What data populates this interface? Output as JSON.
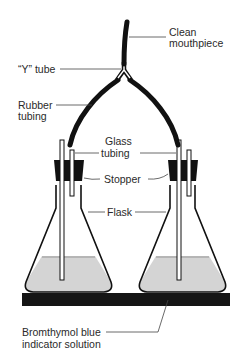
{
  "diagram": {
    "labels": {
      "mouthpiece_line1": "Clean",
      "mouthpiece_line2": "mouthpiece",
      "y_tube": "“Y” tube",
      "rubber_line1": "Rubber",
      "rubber_line2": "tubing",
      "glass_line1": "Glass",
      "glass_line2": "tubing",
      "stopper": "Stopper",
      "flask": "Flask",
      "solution_line1": "Bromthymol blue",
      "solution_line2": "indicator solution"
    },
    "colors": {
      "ink": "#111111",
      "solution": "#d4d4d4",
      "line": "#444444",
      "base": "#151515"
    }
  }
}
